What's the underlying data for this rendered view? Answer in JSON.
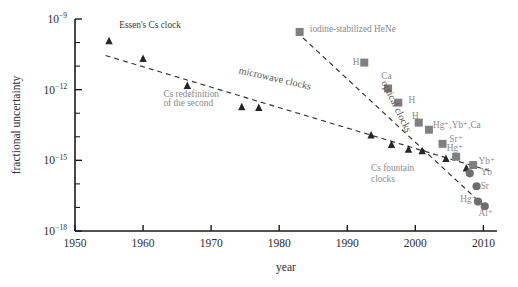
{
  "chart_data": {
    "type": "scatter",
    "title": "",
    "xlabel": "year",
    "ylabel": "fractional uncertainty",
    "xlim": [
      1950,
      2012
    ],
    "ylim_exponent": [
      -18,
      -9
    ],
    "grid": false,
    "legend": "none",
    "xticks": [
      "1950",
      "1960",
      "1970",
      "1980",
      "1990",
      "2000",
      "2010"
    ],
    "xtick_values": [
      1950,
      1960,
      1970,
      1980,
      1990,
      2000,
      2010
    ],
    "yticks": [
      "10−9",
      "10−12",
      "10−15",
      "10−18"
    ],
    "ytick_exponents": [
      -9,
      -12,
      -15,
      -18
    ],
    "ytick_mantissa": "10",
    "ytick_exp_labels": [
      "−9",
      "−12",
      "−15",
      "−18"
    ],
    "series": [
      {
        "name": "microwave clocks (Cs)",
        "marker": "triangle",
        "color": "#262626",
        "points": [
          {
            "x": 1955.0,
            "y_exp": -9.95
          },
          {
            "x": 1960.0,
            "y_exp": -10.7
          },
          {
            "x": 1966.5,
            "y_exp": -11.85
          },
          {
            "x": 1974.5,
            "y_exp": -12.75
          },
          {
            "x": 1977.0,
            "y_exp": -12.78
          },
          {
            "x": 1993.5,
            "y_exp": -13.95
          },
          {
            "x": 1996.5,
            "y_exp": -14.35
          },
          {
            "x": 1999.0,
            "y_exp": -14.55
          },
          {
            "x": 2001.0,
            "y_exp": -14.62
          },
          {
            "x": 2004.5,
            "y_exp": -14.95
          },
          {
            "x": 2007.5,
            "y_exp": -15.35
          }
        ]
      },
      {
        "name": "optical clocks (neutral / stabilized lasers)",
        "marker": "square",
        "color": "#808080",
        "points": [
          {
            "x": 1983.0,
            "y_exp": -9.55,
            "label": "iodine-stabilized HeNe"
          },
          {
            "x": 1992.5,
            "y_exp": -10.85,
            "label": "H"
          },
          {
            "x": 1996.0,
            "y_exp": -11.95,
            "label": "Ca"
          },
          {
            "x": 1997.5,
            "y_exp": -12.55,
            "label": "H"
          },
          {
            "x": 2000.5,
            "y_exp": -13.4,
            "label": "H"
          },
          {
            "x": 2002.0,
            "y_exp": -13.7,
            "label": "Hg⁺, Yb⁺, Ca"
          },
          {
            "x": 2004.0,
            "y_exp": -14.3,
            "label": "Sr⁺"
          },
          {
            "x": 2006.0,
            "y_exp": -14.85,
            "label": "Hg⁺"
          },
          {
            "x": 2008.5,
            "y_exp": -15.2,
            "label": "Yb⁺"
          }
        ]
      },
      {
        "name": "optical clocks (ions / lattice)",
        "marker": "circle",
        "color": "#6e6e6e",
        "points": [
          {
            "x": 2008.0,
            "y_exp": -15.55,
            "label": "Yb"
          },
          {
            "x": 2009.0,
            "y_exp": -16.1,
            "label": "Sr"
          },
          {
            "x": 2009.2,
            "y_exp": -16.75,
            "label": "Hg⁺"
          },
          {
            "x": 2010.2,
            "y_exp": -16.95,
            "label": "Al⁺"
          }
        ]
      }
    ],
    "trend_lines": [
      {
        "name": "microwave-clocks-trend",
        "x1": 1954.5,
        "y1_exp": -10.55,
        "x2": 2011.0,
        "y2_exp": -15.45
      },
      {
        "name": "optical-clocks-trend",
        "x1": 1983.5,
        "y1_exp": -9.8,
        "x2": 2010.5,
        "y2_exp": -17.05
      }
    ],
    "annotations": [
      {
        "name": "essens-cs-clock",
        "text": "Essen's Cs clock",
        "x": 1956.5,
        "y_exp": -9.4,
        "style": "dark",
        "rotate": 0
      },
      {
        "name": "cs-redefinition",
        "text": "Cs redefinition",
        "x": 1963.0,
        "y_exp": -12.3,
        "style": "gray",
        "rotate": 0
      },
      {
        "name": "cs-redefinition-2",
        "text": "of the second",
        "x": 1963.0,
        "y_exp": -12.7,
        "style": "gray",
        "rotate": 0
      },
      {
        "name": "microwave-clocks-band",
        "text": "microwave clocks",
        "x": 1974.0,
        "y_exp": -11.3,
        "style": "band",
        "rotate": 13
      },
      {
        "name": "optical-clocks-band",
        "text": "optical clocks",
        "x": 1995.0,
        "y_exp": -11.7,
        "style": "band",
        "rotate": 64
      },
      {
        "name": "iodine-stabilized-hene",
        "text": "iodine-stabilized HeNe",
        "x": 1984.5,
        "y_exp": -9.55,
        "style": "gray",
        "rotate": 0
      },
      {
        "name": "cs-fountain-clocks",
        "text": "Cs fountain",
        "x": 1993.5,
        "y_exp": -15.45,
        "style": "gray",
        "rotate": 0
      },
      {
        "name": "cs-fountain-clocks-2",
        "text": "clocks",
        "x": 1993.5,
        "y_exp": -15.9,
        "style": "gray",
        "rotate": 0
      },
      {
        "name": "label-H-1",
        "text": "H",
        "x": 1990.8,
        "y_exp": -10.95,
        "style": "gray",
        "rotate": 0
      },
      {
        "name": "label-Ca-1",
        "text": "Ca",
        "x": 1995.0,
        "y_exp": -11.55,
        "style": "gray",
        "rotate": 0
      },
      {
        "name": "label-H-2",
        "text": "H",
        "x": 1999.0,
        "y_exp": -12.55,
        "style": "gray",
        "rotate": 0
      },
      {
        "name": "label-H-3",
        "text": "H",
        "x": 1999.5,
        "y_exp": -13.25,
        "style": "gray",
        "rotate": 0
      },
      {
        "name": "label-HgYbCa",
        "text": "Hg⁺,Yb⁺,Ca",
        "x": 2002.6,
        "y_exp": -13.62,
        "style": "gray",
        "rotate": 0
      },
      {
        "name": "label-Sr-plus",
        "text": "Sr⁺",
        "x": 2005.0,
        "y_exp": -14.22,
        "style": "gray",
        "rotate": 0
      },
      {
        "name": "label-Hg-plus-1",
        "text": "Hg⁺",
        "x": 2004.6,
        "y_exp": -14.62,
        "style": "gray",
        "rotate": 0
      },
      {
        "name": "label-Yb-plus",
        "text": "Yb⁺",
        "x": 2009.3,
        "y_exp": -15.15,
        "style": "gray",
        "rotate": 0
      },
      {
        "name": "label-Yb",
        "text": "Yb",
        "x": 2009.6,
        "y_exp": -15.62,
        "style": "gray",
        "rotate": 0
      },
      {
        "name": "label-Sr",
        "text": "Sr",
        "x": 2009.6,
        "y_exp": -16.2,
        "style": "gray",
        "rotate": 0
      },
      {
        "name": "label-Hg-plus-2",
        "text": "Hg⁺",
        "x": 2006.6,
        "y_exp": -16.78,
        "style": "gray",
        "rotate": 0
      },
      {
        "name": "label-Al-plus",
        "text": "Al⁺",
        "x": 2009.3,
        "y_exp": -17.35,
        "style": "gray",
        "rotate": 0
      }
    ]
  }
}
